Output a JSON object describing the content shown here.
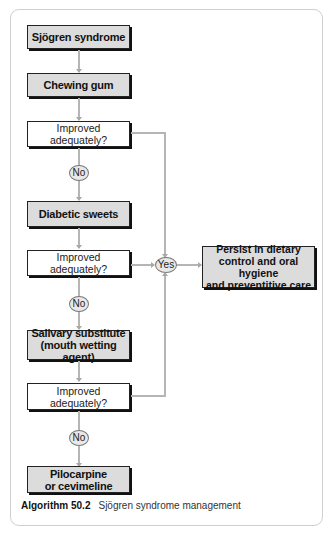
{
  "flowchart": {
    "start": "Sjögren syndrome",
    "steps": [
      {
        "action": "Chewing gum",
        "question": "Improved adequately?",
        "no_label": "No"
      },
      {
        "action": "Diabetic sweets",
        "question": "Improved adequately?",
        "no_label": "No"
      },
      {
        "action_line1": "Salivary substitute",
        "action_line2": "(mouth wetting agent)",
        "question": "Improved adequately?",
        "no_label": "No"
      }
    ],
    "yes_label": "Yes",
    "yes_outcome": {
      "line1": "Persist in dietary",
      "line2": "control and oral hygiene",
      "line3": "and preventitive care"
    },
    "final": {
      "line1": "Pilocarpine",
      "line2": "or cevimeline"
    }
  },
  "caption": {
    "label": "Algorithm 50.2",
    "text": "Sjögren syndrome management"
  },
  "colors": {
    "action_box_fill": "#dcdcdc",
    "connector": "#b5b5b5",
    "border": "#222222"
  }
}
